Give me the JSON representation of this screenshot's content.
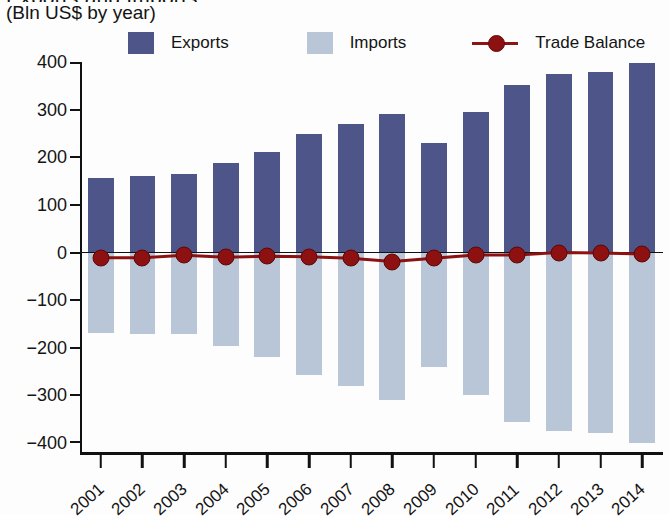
{
  "title_clipped": "Exports and Imports",
  "subtitle": "(Bln US$ by year)",
  "legend": {
    "exports_label": "Exports",
    "imports_label": "Imports",
    "balance_label": "Trade Balance"
  },
  "colors": {
    "exports": "#4e5689",
    "imports": "#b9c6d7",
    "trade_balance": "#8d1111",
    "axis": "#111111"
  },
  "chart_data": {
    "type": "bar",
    "title": "Exports and Imports",
    "subtitle": "(Bln US$ by year)",
    "xlabel": "",
    "ylabel": "(Bln US$ by year)",
    "ylim": [
      -400,
      400
    ],
    "yticks": [
      400,
      300,
      200,
      100,
      0,
      -100,
      -200,
      -300,
      -400
    ],
    "ytick_labels": [
      "400",
      "300",
      "200",
      "100",
      "0",
      "−100",
      "−200",
      "−300",
      "−400"
    ],
    "grid": false,
    "legend_position": "top",
    "categories": [
      "2001",
      "2002",
      "2003",
      "2004",
      "2005",
      "2006",
      "2007",
      "2008",
      "2009",
      "2010",
      "2011",
      "2012",
      "2013",
      "2014"
    ],
    "series": [
      {
        "name": "Exports",
        "type": "bar",
        "color": "#4e5689",
        "values": [
          157,
          160,
          165,
          187,
          212,
          248,
          269,
          291,
          229,
          295,
          351,
          374,
          379,
          397
        ]
      },
      {
        "name": "Imports",
        "type": "bar",
        "color": "#b9c6d7",
        "values": [
          -168,
          -171,
          -171,
          -197,
          -220,
          -257,
          -281,
          -310,
          -241,
          -300,
          -356,
          -374,
          -379,
          -400
        ]
      },
      {
        "name": "Trade Balance",
        "type": "line",
        "color": "#8d1111",
        "values": [
          -11,
          -11,
          -6,
          -10,
          -8,
          -9,
          -12,
          -19,
          -12,
          -5,
          -5,
          0,
          -1,
          -3
        ]
      }
    ]
  }
}
